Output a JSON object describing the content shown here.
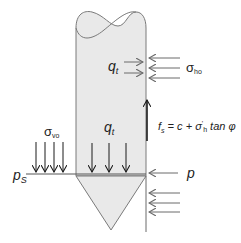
{
  "diagram": {
    "colors": {
      "pile_fill": "#e9e9e9",
      "pile_stroke": "#7a7a7a",
      "arrow_dark": "#1a1a1a",
      "arrow_grey": "#6a6a6a",
      "text": "#222222"
    },
    "labels": {
      "qt_side": {
        "main": "q",
        "sub": "t"
      },
      "sigma_ho": {
        "main": "σ",
        "sub": "ho"
      },
      "fs_equation": {
        "lhs_main": "f",
        "lhs_sub": "s",
        "rhs": " = c + σ",
        "prime": "'",
        "rhs_sub": "h",
        "tail": " tan φ"
      },
      "sigma_vo": {
        "main": "σ",
        "sub": "vo"
      },
      "qt_base": {
        "main": "q",
        "sub": "t"
      },
      "ps": {
        "main": "p",
        "sub": "S"
      },
      "p": {
        "main": "p"
      }
    },
    "arrows": {
      "horizontal_right_of_pile_upper": 3,
      "qt_side_arrows": 2,
      "sigma_vo_down_arrows": 4,
      "qt_base_down_arrows": 3,
      "p_arrow": 1,
      "lower_right_arrows": 3,
      "friction_up_arrow": 1
    }
  }
}
